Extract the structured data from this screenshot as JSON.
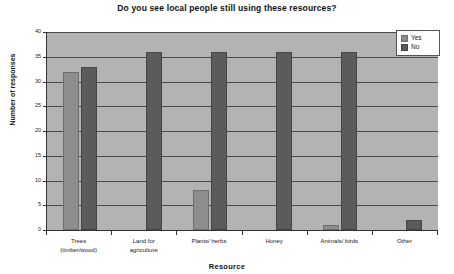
{
  "chart_data": {
    "type": "bar",
    "title": "Do you see local people still using these resources?",
    "xlabel": "Resource",
    "ylabel": "Number of responses",
    "ylim": [
      0,
      40
    ],
    "ytick_step": 5,
    "yticks": [
      "0",
      "5",
      "10",
      "15",
      "20",
      "25",
      "30",
      "35",
      "40"
    ],
    "grid": true,
    "legend_position": "top-right",
    "categories": [
      "Trees (timber/wood)",
      "Land for agriculture",
      "Plants/ herbs",
      "Honey",
      "Animals/ birds",
      "Other"
    ],
    "category_lines": [
      [
        "Trees",
        "(timber/wood)"
      ],
      [
        "Land for",
        "agriculture"
      ],
      [
        "Plants/ herbs"
      ],
      [
        "Honey"
      ],
      [
        "Animals/ birds"
      ],
      [
        "Other"
      ]
    ],
    "series": [
      {
        "name": "Yes",
        "color": "#8d8d8d",
        "values": [
          32,
          0,
          8,
          0,
          1,
          0
        ]
      },
      {
        "name": "No",
        "color": "#5b5b5b",
        "values": [
          33,
          36,
          36,
          36,
          36,
          2
        ]
      }
    ]
  },
  "legend": {
    "items": [
      {
        "label": "Yes"
      },
      {
        "label": "No"
      }
    ]
  }
}
